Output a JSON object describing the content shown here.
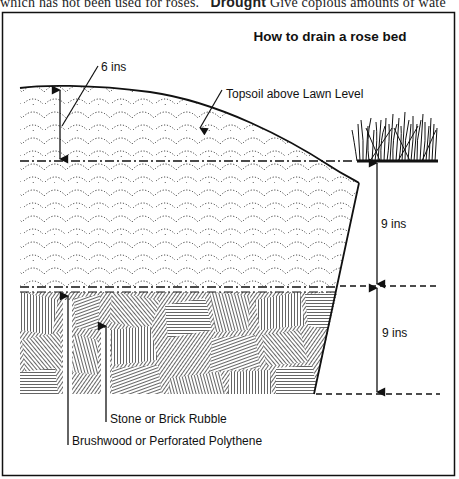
{
  "page_fragment": {
    "left_text": "which has not been used for roses.",
    "bold_word": "Drought",
    "right_text": "Give copious amounts of wate"
  },
  "diagram": {
    "title": "How to drain a rose bed",
    "labels": {
      "topsoil_depth": "6 ins",
      "topsoil": "Topsoil above Lawn Level",
      "upper_depth": "9 ins",
      "lower_depth": "9 ins",
      "rubble": "Stone or Brick Rubble",
      "brushwood": "Brushwood or Perforated Polythene"
    },
    "layers": [
      {
        "name": "Topsoil above lawn level",
        "depth": "6 ins",
        "pattern": "dotted scallops"
      },
      {
        "name": "Soil below lawn level",
        "depth": "9 ins",
        "pattern": "dotted scallops"
      },
      {
        "name": "Drainage rubble layer",
        "depth": "9 ins",
        "pattern": "hatched rubble"
      }
    ],
    "colors": {
      "ink": "#111111",
      "paper": "#ffffff"
    }
  }
}
